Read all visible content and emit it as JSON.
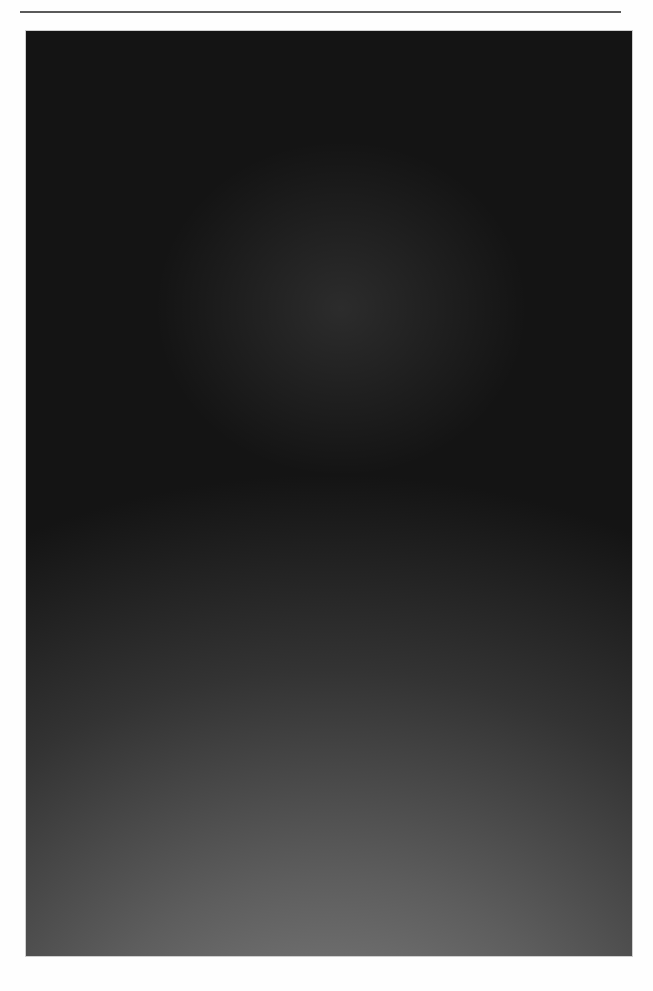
{
  "page": {
    "kind": "printed-book-plate-page",
    "background_color": "#fefefe",
    "width": 653,
    "height": 991
  },
  "running_head": {
    "text": "",
    "note_visible": "top line of running head is cropped off above the page edge; only letter descenders remain and no word is legible",
    "rule_color": "#5a5a5a"
  },
  "plate": {
    "caption": "",
    "frame": {
      "x": 26,
      "y": 31,
      "width": 606,
      "height": 925
    },
    "medium": "halftone-screened black-and-white photograph",
    "scene_description": "Interior of a huge spherical water-Cherenkov particle detector tank, walls completely tiled with a dense regular array of large spherical photomultiplier tubes curving away in all directions; a bright lamp near the top casts radiating rays, several detector spheres glow brilliantly, and a small inflatable boat floats on the water near the bottom.",
    "tones": {
      "highlight": "#ffffff",
      "midtone": "#7d7d7d",
      "shadow": "#141414",
      "deep_shadow": "#0a0a0a"
    },
    "lights": [
      {
        "name": "main-lamp",
        "x": 0.53,
        "y": 0.107,
        "radius": 0.035,
        "intensity": 1.0
      },
      {
        "name": "glow-sphere-1",
        "x": 0.195,
        "y": 0.213,
        "radius": 0.03,
        "intensity": 0.97
      },
      {
        "name": "glow-sphere-2",
        "x": 0.353,
        "y": 0.237,
        "radius": 0.026,
        "intensity": 0.95
      },
      {
        "name": "glow-sphere-3",
        "x": 0.485,
        "y": 0.277,
        "radius": 0.027,
        "intensity": 0.96
      },
      {
        "name": "glow-sphere-4",
        "x": 0.635,
        "y": 0.314,
        "radius": 0.026,
        "intensity": 0.94
      },
      {
        "name": "glow-sphere-5",
        "x": 0.369,
        "y": 0.32,
        "radius": 0.026,
        "intensity": 0.95
      },
      {
        "name": "glow-sphere-6",
        "x": 0.338,
        "y": 0.383,
        "radius": 0.024,
        "intensity": 0.93
      }
    ],
    "ray_origin": {
      "x": 0.515,
      "y": 0.145
    },
    "ray_count": 26,
    "cable_streaks": [
      {
        "name": "upper-cable",
        "y": 0.168,
        "amplitude": 0.012
      },
      {
        "name": "lower-cable",
        "y": 0.188,
        "amplitude": 0.006
      }
    ],
    "boat": {
      "name": "inflatable-boat",
      "x": 0.455,
      "y": 0.875,
      "width": 0.055,
      "height": 0.016
    },
    "pmt_array": {
      "description": "regular grid of photomultiplier-tube spheres",
      "columns": 68,
      "rows": 52,
      "sphere_highlight": "#f2f2f2"
    },
    "halftone": {
      "screen_pitch_px": 3,
      "angle_deg": 45
    }
  }
}
